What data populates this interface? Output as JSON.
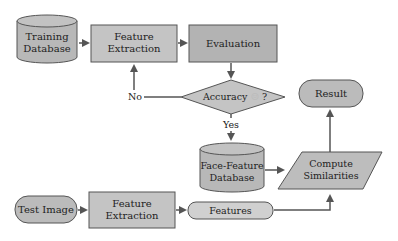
{
  "diagram": {
    "colors": {
      "fill_dark": "#b3b3b3",
      "fill_mid": "#bdbdbd",
      "fill_light": "#d0d0d0",
      "stroke": "#555555",
      "arrow": "#555555"
    },
    "nodes": {
      "training_db": {
        "line1": "Training",
        "line2": "Database"
      },
      "feature_extraction_top": {
        "line1": "Feature",
        "line2": "Extraction"
      },
      "evaluation": {
        "label": "Evaluation"
      },
      "accuracy": {
        "label": "Accuracy",
        "symbol": "☺",
        "suffix": "?"
      },
      "face_feature_db": {
        "line1": "Face-Feature",
        "line2": "Database"
      },
      "compute_similarities": {
        "line1": "Compute",
        "line2": "Similarities"
      },
      "result": {
        "label": "Result"
      },
      "test_image": {
        "label": "Test Image"
      },
      "feature_extraction_bottom": {
        "line1": "Feature",
        "line2": "Extraction"
      },
      "features": {
        "label": "Features"
      }
    },
    "edges": {
      "no_label": "No",
      "yes_label": "Yes"
    }
  }
}
